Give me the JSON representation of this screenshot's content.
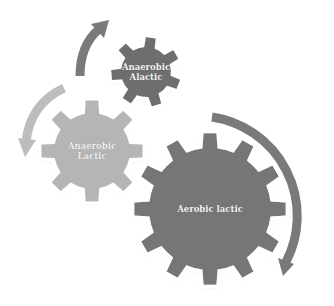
{
  "diagram": {
    "gears": [
      {
        "id": "anaerobic-alactic",
        "label_line1": "Anaerobic",
        "label_line2": "Alactic",
        "color": "#6e6e6e",
        "cx": 146,
        "cy": 72,
        "outer_r": 35,
        "inner_r": 25,
        "teeth": 7,
        "rotation": 8
      },
      {
        "id": "anaerobic-lactic",
        "label_line1": "Anaerobic",
        "label_line2": "Lactic",
        "color": "#b5b5b5",
        "cx": 92,
        "cy": 151,
        "outer_r": 51,
        "inner_r": 38,
        "teeth": 8,
        "rotation": 0
      },
      {
        "id": "aerobic-lactic",
        "label_line1": "Aerobic lactic",
        "label_line2": "",
        "color": "#767676",
        "cx": 210,
        "cy": 209,
        "outer_r": 76,
        "inner_r": 61,
        "teeth": 12,
        "rotation": 0
      }
    ],
    "arrows": [
      {
        "id": "arrow-top",
        "color": "#7a7a7a",
        "direction": "up-right"
      },
      {
        "id": "arrow-left",
        "color": "#bdbdbd",
        "direction": "down-left"
      },
      {
        "id": "arrow-right",
        "color": "#7a7a7a",
        "direction": "down-clockwise"
      }
    ],
    "background": "#ffffff"
  }
}
